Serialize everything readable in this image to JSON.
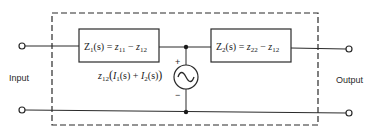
{
  "diagram": {
    "type": "two-port T-equivalent network with dependent voltage source",
    "input_label": "Input",
    "output_label": "Output",
    "box1": {
      "lhs": "Z",
      "lhs_sub": "1",
      "lhs_arg": "(s)",
      "eq": " = ",
      "t1": "z",
      "t1_sub": "11",
      "minus": " − ",
      "t2": "z",
      "t2_sub": "12"
    },
    "box2": {
      "lhs": "Z",
      "lhs_sub": "2",
      "lhs_arg": "(s)",
      "eq": " = ",
      "t1": "z",
      "t1_sub": "22",
      "minus": " − ",
      "t2": "z",
      "t2_sub": "12"
    },
    "source": {
      "coef": "z",
      "coef_sub": "12",
      "open": "(",
      "i1": "I",
      "i1_sub": "1",
      "i1_arg": "(s)",
      "plus": " + ",
      "i2": "I",
      "i2_sub": "2",
      "i2_arg": "(s)",
      "close": ")",
      "plus_sign": "+",
      "minus_sign": "−",
      "symbol": "~"
    },
    "colors": {
      "line": "#2a2a2a",
      "background": "#ffffff"
    }
  }
}
